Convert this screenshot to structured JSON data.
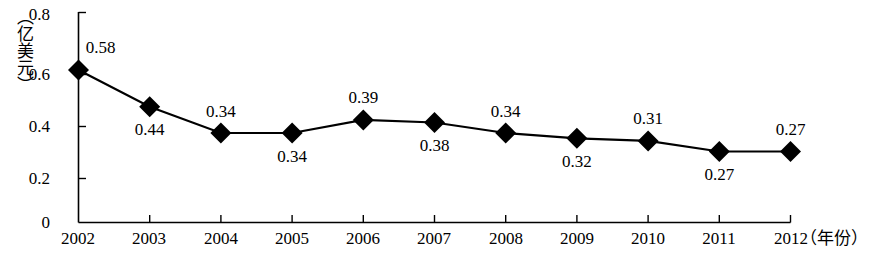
{
  "chart_data": {
    "type": "line",
    "title": "",
    "xlabel": "（年份）",
    "ylabel": "（亿美元）",
    "categories": [
      "2002",
      "2003",
      "2004",
      "2005",
      "2006",
      "2007",
      "2008",
      "2009",
      "2010",
      "2011",
      "2012"
    ],
    "values": [
      0.58,
      0.44,
      0.34,
      0.34,
      0.39,
      0.38,
      0.34,
      0.32,
      0.31,
      0.27,
      0.27
    ],
    "data_labels": [
      "0.58",
      "0.44",
      "0.34",
      "0.34",
      "0.39",
      "0.38",
      "0.34",
      "0.32",
      "0.31",
      "0.27",
      "0.27"
    ],
    "label_positions": [
      "above",
      "below",
      "above",
      "below",
      "above",
      "below",
      "above",
      "below",
      "above",
      "below",
      "above"
    ],
    "ylim": [
      0,
      0.8
    ],
    "ytick_labels": [
      "0",
      "0.2",
      "0.4",
      "0.6",
      "0.8"
    ],
    "ytick_values": [
      0,
      0.2,
      0.4,
      0.6,
      0.8
    ],
    "grid": false,
    "legend": null,
    "marker": "diamond",
    "series_color": "#000000",
    "background_color": "#ffffff"
  }
}
